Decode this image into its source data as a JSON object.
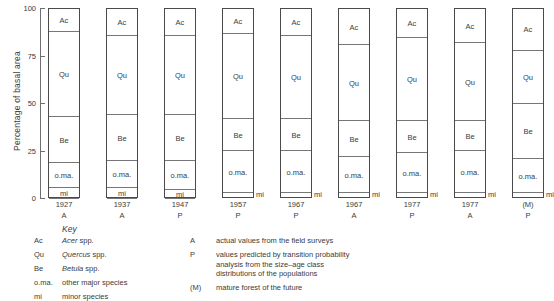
{
  "chart_data": {
    "type": "bar",
    "title": "",
    "xlabel": "",
    "ylabel": "Percentage of basal area",
    "ylim": [
      0,
      100
    ],
    "yticks": [
      "0",
      "25",
      "50",
      "75",
      "100"
    ],
    "grid": false,
    "stacked": true,
    "legend": "below",
    "categories": [
      "1927",
      "1937",
      "1947",
      "1957",
      "1967",
      "1967",
      "1977",
      "1977",
      "(M)"
    ],
    "category_codes": [
      "A",
      "A",
      "P",
      "P",
      "P",
      "A",
      "P",
      "A",
      "P"
    ],
    "series": [
      {
        "name": "Ac",
        "label": "Ac",
        "values": [
          12,
          14,
          14,
          13,
          14,
          19,
          15,
          18,
          22
        ]
      },
      {
        "name": "Qu",
        "label": "Qu",
        "values": [
          45,
          42,
          42,
          45,
          44,
          40,
          44,
          41,
          28
        ]
      },
      {
        "name": "Be",
        "label": "Be",
        "values": [
          24,
          24,
          24,
          17,
          17,
          19,
          17,
          16,
          29
        ]
      },
      {
        "name": "o.ma.",
        "label": "o.ma.",
        "values": [
          13,
          14,
          15,
          22,
          22,
          19,
          21,
          22,
          18
        ]
      },
      {
        "name": "mi",
        "label": "mi",
        "values": [
          6,
          6,
          5,
          3,
          3,
          3,
          3,
          3,
          3
        ]
      }
    ],
    "columns": [
      {
        "year": "1927",
        "code": "A",
        "segments": [
          {
            "key": "Ac",
            "label": "Ac",
            "value": 12,
            "inside": true
          },
          {
            "key": "Qu",
            "label": "Qu",
            "value": 45,
            "inside": true
          },
          {
            "key": "Be",
            "label": "Be",
            "value": 24,
            "inside": true
          },
          {
            "key": "o.ma.",
            "label": "o.ma.",
            "value": 13,
            "inside": true
          },
          {
            "key": "mi",
            "label": "mi",
            "value": 6,
            "inside": true
          }
        ]
      },
      {
        "year": "1937",
        "code": "A",
        "segments": [
          {
            "key": "Ac",
            "label": "Ac",
            "value": 14,
            "inside": true
          },
          {
            "key": "Qu",
            "label": "Qu",
            "value": 42,
            "inside": true
          },
          {
            "key": "Be",
            "label": "Be",
            "value": 24,
            "inside": true
          },
          {
            "key": "o.ma.",
            "label": "o.ma.",
            "value": 14,
            "inside": true
          },
          {
            "key": "mi",
            "label": "mi",
            "value": 6,
            "inside": true
          }
        ]
      },
      {
        "year": "1947",
        "code": "P",
        "segments": [
          {
            "key": "Ac",
            "label": "Ac",
            "value": 14,
            "inside": true
          },
          {
            "key": "Qu",
            "label": "Qu",
            "value": 42,
            "inside": true
          },
          {
            "key": "Be",
            "label": "Be",
            "value": 24,
            "inside": true
          },
          {
            "key": "o.ma.",
            "label": "o.ma.",
            "value": 15,
            "inside": true
          },
          {
            "key": "mi",
            "label": "mi",
            "value": 5,
            "inside": true
          }
        ]
      },
      {
        "year": "1957",
        "code": "P",
        "segments": [
          {
            "key": "Ac",
            "label": "Ac",
            "value": 13,
            "inside": true
          },
          {
            "key": "Qu",
            "label": "Qu",
            "value": 45,
            "inside": true
          },
          {
            "key": "Be",
            "label": "Be",
            "value": 17,
            "inside": true
          },
          {
            "key": "o.ma.",
            "label": "o.ma.",
            "value": 22,
            "inside": true
          },
          {
            "key": "mi",
            "label": "mi",
            "value": 3,
            "inside": false
          }
        ]
      },
      {
        "year": "1967",
        "code": "P",
        "segments": [
          {
            "key": "Ac",
            "label": "Ac",
            "value": 14,
            "inside": true
          },
          {
            "key": "Qu",
            "label": "Qu",
            "value": 44,
            "inside": true
          },
          {
            "key": "Be",
            "label": "Be",
            "value": 17,
            "inside": true
          },
          {
            "key": "o.ma.",
            "label": "o.ma.",
            "value": 22,
            "inside": true
          },
          {
            "key": "mi",
            "label": "mi",
            "value": 3,
            "inside": false
          }
        ]
      },
      {
        "year": "1967",
        "code": "A",
        "segments": [
          {
            "key": "Ac",
            "label": "Ac",
            "value": 19,
            "inside": true
          },
          {
            "key": "Qu",
            "label": "Qu",
            "value": 40,
            "inside": true
          },
          {
            "key": "Be",
            "label": "Be",
            "value": 19,
            "inside": true
          },
          {
            "key": "o.ma.",
            "label": "o.ma.",
            "value": 19,
            "inside": true
          },
          {
            "key": "mi",
            "label": "mi",
            "value": 3,
            "inside": false
          }
        ]
      },
      {
        "year": "1977",
        "code": "P",
        "segments": [
          {
            "key": "Ac",
            "label": "Ac",
            "value": 15,
            "inside": true
          },
          {
            "key": "Qu",
            "label": "Qu",
            "value": 44,
            "inside": true
          },
          {
            "key": "Be",
            "label": "Be",
            "value": 17,
            "inside": true
          },
          {
            "key": "o.ma.",
            "label": "o.ma.",
            "value": 21,
            "inside": true
          },
          {
            "key": "mi",
            "label": "mi",
            "value": 3,
            "inside": false
          }
        ]
      },
      {
        "year": "1977",
        "code": "A",
        "segments": [
          {
            "key": "Ac",
            "label": "Ac",
            "value": 18,
            "inside": true
          },
          {
            "key": "Qu",
            "label": "Qu",
            "value": 41,
            "inside": true
          },
          {
            "key": "Be",
            "label": "Be",
            "value": 16,
            "inside": true
          },
          {
            "key": "o.ma.",
            "label": "o.ma.",
            "value": 22,
            "inside": true
          },
          {
            "key": "mi",
            "label": "mi",
            "value": 3,
            "inside": false
          }
        ]
      },
      {
        "year": "(M)",
        "code": "P",
        "segments": [
          {
            "key": "Ac",
            "label": "Ac",
            "value": 22,
            "inside": true
          },
          {
            "key": "Qu",
            "label": "Qu",
            "value": 28,
            "inside": true
          },
          {
            "key": "Be",
            "label": "Be",
            "value": 29,
            "inside": true
          },
          {
            "key": "o.ma.",
            "label": "o.ma.",
            "value": 18,
            "inside": true
          },
          {
            "key": "mi",
            "label": "mi",
            "value": 3,
            "inside": false
          }
        ]
      }
    ]
  },
  "key": {
    "title": "Key",
    "species": [
      {
        "symbol": "Ac",
        "name_italic": "Acer",
        "name_roman": " spp."
      },
      {
        "symbol": "Qu",
        "name_italic": "Quercus",
        "name_roman": " spp."
      },
      {
        "symbol": "Be",
        "name_italic": "Betula",
        "name_roman": " spp."
      },
      {
        "symbol": "o.ma.",
        "name_italic": "",
        "name_roman": "other major species"
      },
      {
        "symbol": "mi",
        "name_italic": "",
        "name_roman": "minor species"
      }
    ],
    "codes": [
      {
        "symbol": "A",
        "lines": [
          "actual values from the field surveys"
        ]
      },
      {
        "symbol": "P",
        "lines": [
          "values predicted by transition probability",
          "analysis from the size–age class",
          "distributions of the populations"
        ]
      },
      {
        "symbol": "(M)",
        "lines": [
          "mature forest of the future"
        ]
      }
    ]
  }
}
